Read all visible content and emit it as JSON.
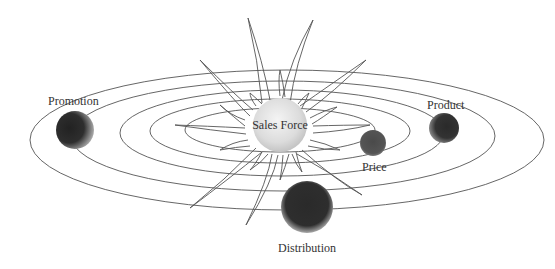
{
  "diagram": {
    "center": {
      "label": "Sales Force",
      "color": "#d8d8d8"
    },
    "planets": [
      {
        "label": "Promotion",
        "color": "#2e2e2e"
      },
      {
        "label": "Product",
        "color": "#3a3a3a"
      },
      {
        "label": "Price",
        "color": "#555555"
      },
      {
        "label": "Distribution",
        "color": "#2a2a2a"
      }
    ],
    "orbit_count": 5
  }
}
